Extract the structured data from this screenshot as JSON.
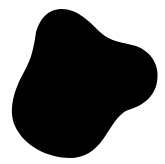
{
  "canvas": {
    "width": 165,
    "height": 164,
    "background": "#ffffff"
  },
  "shape": {
    "type": "blob",
    "fill": "#000000",
    "path": "M 60 9 C 76 8 88 20 100 32 C 110 42 122 42 136 46 C 152 52 160 66 157 82 C 154 98 142 106 128 110 C 118 114 112 126 104 138 C 94 152 84 158 70 158 C 48 158 24 146 15 126 C 8 110 14 90 24 72 C 32 58 34 46 36 32 C 40 18 48 10 60 9 Z"
  }
}
